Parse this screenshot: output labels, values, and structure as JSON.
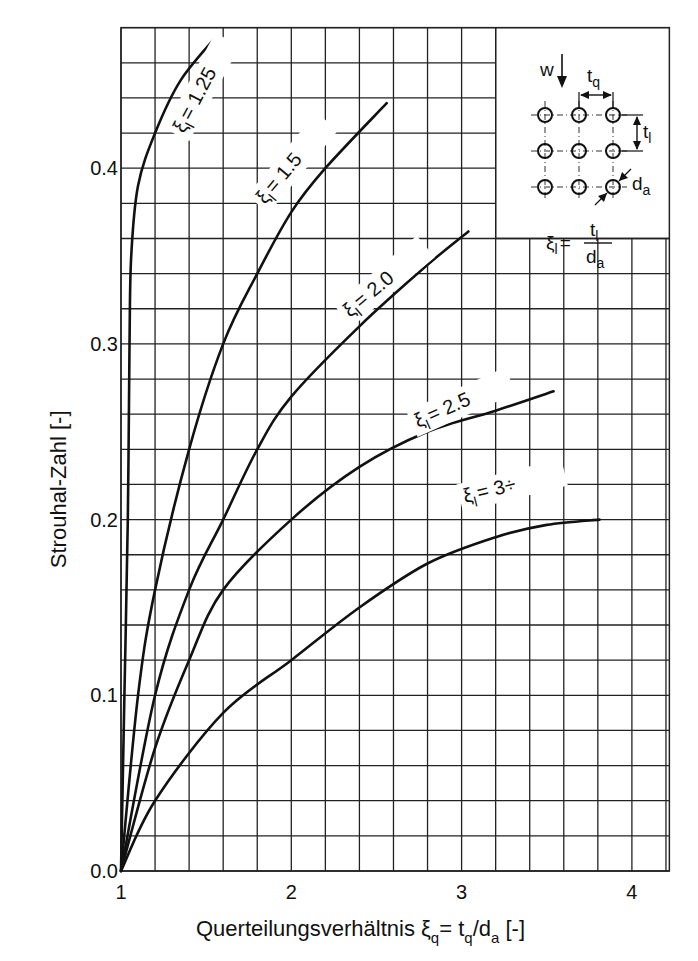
{
  "chart_data": {
    "type": "line",
    "title": "",
    "xlabel": "Querteilungsverhältnis ξq = tq/da [-]",
    "xlabel_parts": {
      "main": "Querteilungsverhältnis ξ",
      "sub1": "q",
      "mid": "= t",
      "sub2": "q",
      "mid2": "/d",
      "sub3": "a",
      "end": " [-]"
    },
    "ylabel": "Strouhal-Zahl [-]",
    "xlim": [
      1,
      4.22
    ],
    "ylim": [
      0,
      0.48
    ],
    "x_ticks": [
      1,
      2,
      3,
      4
    ],
    "x_tick_labels": [
      "1",
      "2",
      "3",
      "4"
    ],
    "y_ticks": [
      0.0,
      0.1,
      0.2,
      0.3,
      0.4
    ],
    "y_tick_labels": [
      "0.0",
      "0.1",
      "0.2",
      "0.3",
      "0.4"
    ],
    "grid": true,
    "grid_x_step": 0.2,
    "grid_y_step": 0.02,
    "legend": "inline curve labels",
    "series": [
      {
        "name": "ξl = 1.25",
        "label_sym": "ξ",
        "label_sub": "l",
        "label_val": "= 1.25",
        "x": [
          1.0,
          1.02,
          1.04,
          1.05,
          1.06,
          1.1,
          1.2,
          1.35,
          1.56
        ],
        "y": [
          0.0,
          0.1,
          0.2,
          0.3,
          0.35,
          0.39,
          0.42,
          0.45,
          0.475
        ]
      },
      {
        "name": "ξl = 1.5",
        "label_sym": "ξ",
        "label_sub": "l",
        "label_val": "= 1.5",
        "x": [
          1.0,
          1.1,
          1.2,
          1.4,
          1.6,
          1.8,
          2.0,
          2.2,
          2.56
        ],
        "y": [
          0.0,
          0.1,
          0.16,
          0.24,
          0.3,
          0.34,
          0.375,
          0.4,
          0.437
        ]
      },
      {
        "name": "ξl = 2.0",
        "label_sym": "ξ",
        "label_sub": "l",
        "label_val": "= 2.0",
        "x": [
          1.0,
          1.2,
          1.4,
          1.6,
          1.8,
          2.0,
          2.4,
          2.8,
          3.04
        ],
        "y": [
          0.0,
          0.1,
          0.16,
          0.2,
          0.24,
          0.27,
          0.31,
          0.345,
          0.364
        ]
      },
      {
        "name": "ξl = 2.5",
        "label_sym": "ξ",
        "label_sub": "l",
        "label_val": "= 2.5",
        "x": [
          1.0,
          1.2,
          1.4,
          1.6,
          2.0,
          2.4,
          2.8,
          3.2,
          3.54
        ],
        "y": [
          0.0,
          0.07,
          0.12,
          0.16,
          0.2,
          0.23,
          0.25,
          0.262,
          0.273
        ]
      },
      {
        "name": "ξl = 3÷",
        "label_sym": "ξ",
        "label_sub": "l",
        "label_val": "= 3÷",
        "x": [
          1.0,
          1.2,
          1.6,
          2.0,
          2.4,
          2.8,
          3.2,
          3.5,
          3.81
        ],
        "y": [
          0.0,
          0.04,
          0.09,
          0.12,
          0.15,
          0.175,
          0.19,
          0.197,
          0.2
        ]
      }
    ],
    "annotations": {
      "inset": {
        "flow_label": "w",
        "tq_label": "t",
        "tq_sub": "q",
        "tl_label": "t",
        "tl_sub": "l",
        "da_label": "d",
        "da_sub": "a",
        "formula_lhs": "ξ",
        "formula_lhs_sub": "l",
        "formula_eq": "=",
        "formula_num": "t",
        "formula_num_sub": "l",
        "formula_den": "d",
        "formula_den_sub": "a"
      }
    }
  },
  "colors": {
    "line": "#111111",
    "grid": "#222222",
    "background": "#ffffff"
  }
}
